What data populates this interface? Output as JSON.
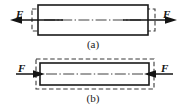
{
  "figure": {
    "background_color": "#ffffff",
    "line_color": "#1a1a1a",
    "dashed_color": "#333333",
    "width": 186,
    "height": 108
  },
  "panels": [
    {
      "id": "a",
      "caption": "(a)",
      "loading": "tension",
      "force_label_left": "F",
      "force_label_right": "F",
      "left_arrow_direction": "left",
      "right_arrow_direction": "right",
      "deformed_outline": "inside",
      "solid_body": {
        "x": 38,
        "y": 5,
        "width": 110,
        "height": 30
      },
      "dashed_body": {
        "x": 32,
        "y": 9,
        "width": 123,
        "height": 22
      },
      "centerline_y": 20,
      "left_arrow": {
        "x1": 63,
        "y1": 20,
        "x2": 12,
        "y2": 20
      },
      "right_arrow": {
        "x1": 123,
        "y1": 20,
        "x2": 175,
        "y2": 20
      }
    },
    {
      "id": "b",
      "caption": "(b)",
      "loading": "compression",
      "force_label_left": "F",
      "force_label_right": "F",
      "left_arrow_direction": "right",
      "right_arrow_direction": "left",
      "deformed_outline": "outside",
      "solid_body": {
        "x": 40,
        "y": 9,
        "width": 109,
        "height": 22
      },
      "dashed_body": {
        "x": 36,
        "y": 5,
        "width": 118,
        "height": 30
      },
      "centerline_y": 20,
      "left_arrow": {
        "x1": 14,
        "y1": 20,
        "x2": 44,
        "y2": 20
      },
      "right_arrow": {
        "x1": 175,
        "y1": 20,
        "x2": 145,
        "y2": 20
      }
    }
  ],
  "icons": {
    "arrow_head": "solid-triangle-arrowhead",
    "centerline": "dash-dot-axis-line"
  }
}
